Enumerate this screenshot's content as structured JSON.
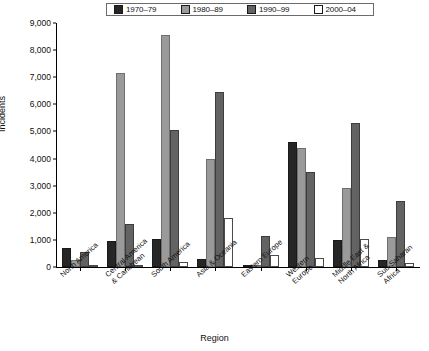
{
  "chart_data": {
    "type": "bar",
    "title": "",
    "xlabel": "Region",
    "ylabel": "Incidents",
    "ylim": [
      0,
      9000
    ],
    "ytick_labels": [
      "9,000",
      "8,000",
      "7,000",
      "6,000",
      "5,000",
      "4,000",
      "3,000",
      "2,000",
      "1,000",
      "0"
    ],
    "ytick_values": [
      9000,
      8000,
      7000,
      6000,
      5000,
      4000,
      3000,
      2000,
      1000,
      0
    ],
    "grid": false,
    "legend_position": "top-center",
    "categories": [
      "North America",
      "Central America\n& Caribbean",
      "South America",
      "Asia & Oceania",
      "Eastern Europe",
      "Western\nEurope",
      "Middle East &\nNorth Africa",
      "Sub-Saharan\nAfrica"
    ],
    "series": [
      {
        "name": "1970–79",
        "color": "#262626",
        "values": [
          700,
          950,
          1050,
          300,
          0,
          4600,
          1000,
          250
        ]
      },
      {
        "name": "1980–89",
        "color": "#9a9a9a",
        "values": [
          250,
          7150,
          8550,
          4000,
          0,
          4400,
          2900,
          1100
        ]
      },
      {
        "name": "1990–99",
        "color": "#636363",
        "values": [
          550,
          1600,
          5050,
          6450,
          1150,
          3500,
          5300,
          2450
        ]
      },
      {
        "name": "2000–04",
        "color": "#ffffff",
        "values": [
          60,
          30,
          200,
          1800,
          450,
          350,
          1050,
          150
        ]
      }
    ]
  },
  "legend": {
    "items": [
      {
        "label": "1970–79",
        "swatch": "#262626"
      },
      {
        "label": "1980–89",
        "swatch": "#9a9a9a"
      },
      {
        "label": "1990–99",
        "swatch": "#636363"
      },
      {
        "label": "2000–04",
        "swatch": "#ffffff"
      }
    ]
  }
}
